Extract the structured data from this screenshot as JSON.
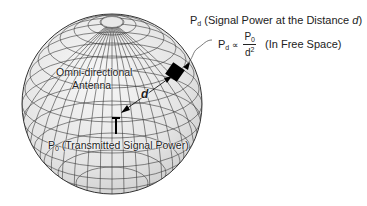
{
  "figure": {
    "type": "free-space propagation diagram",
    "sphere": {
      "center_x": 112,
      "center_y": 104,
      "radius": 90,
      "fill": "#e6e6e6",
      "grid_color": "#333333"
    }
  },
  "labels": {
    "receiver_title": {
      "main": "P",
      "sub": "d",
      "text": " (Signal Power at the Distance ",
      "italic": "d",
      "tail": ")"
    },
    "formula": {
      "lhs": "P",
      "lhs_sub": "d",
      "relation": "∝",
      "num": "P",
      "num_sub": "0",
      "den": "d",
      "den_sup": "2",
      "note": "(In Free Space)"
    },
    "antenna_line1": "Omni-directional",
    "antenna_line2": "Antenna",
    "distance": "d",
    "transmitter": {
      "main": "P",
      "sub": "0",
      "text": " (Transmitted Signal Power)"
    }
  },
  "icons": {
    "transmitter": "antenna-mast-icon",
    "receiver": "receiver-diamond-icon"
  }
}
